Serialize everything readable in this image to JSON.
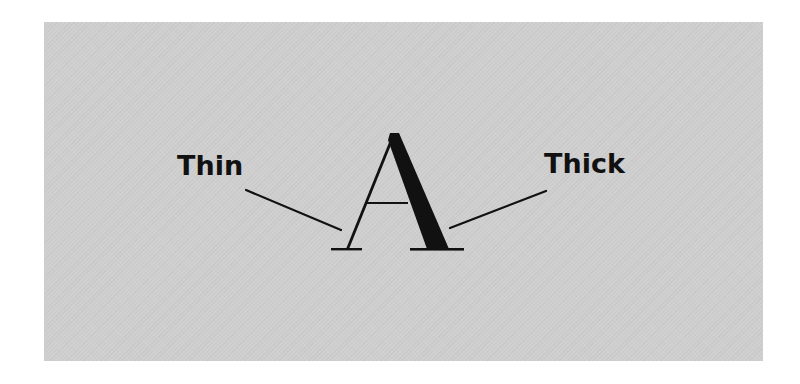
{
  "diagram": {
    "glyph": "A",
    "labels": {
      "thin": "Thin",
      "thick": "Thick"
    },
    "annotations": [
      {
        "label": "Thin",
        "points_to": "left thin stroke of A"
      },
      {
        "label": "Thick",
        "points_to": "right thick stroke of A"
      }
    ],
    "colors": {
      "background": "#ffffff",
      "panel": "#cfcfcf",
      "ink": "#111111"
    }
  }
}
